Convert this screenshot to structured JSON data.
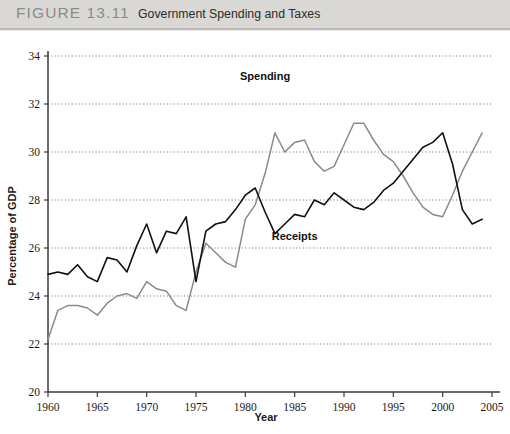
{
  "header": {
    "figure_number": "FIGURE 13.11",
    "figure_title": "Government Spending and Taxes",
    "band_color": "#d9d8d4"
  },
  "chart_data": {
    "type": "line",
    "title": "Government Spending and Taxes",
    "xlabel": "Year",
    "ylabel": "Percentage of GDP",
    "xlim": [
      1960,
      2005
    ],
    "ylim": [
      20,
      34
    ],
    "xticks": [
      1960,
      1965,
      1970,
      1975,
      1980,
      1985,
      1990,
      1995,
      2000,
      2005
    ],
    "yticks": [
      20,
      22,
      24,
      26,
      28,
      30,
      32,
      34
    ],
    "grid": "horizontal-dotted",
    "legend": "inline-annotations",
    "annotations": [
      {
        "text": "Spending",
        "x": 1982.0,
        "y": 33.0
      },
      {
        "text": "Receipts",
        "x": 1985.0,
        "y": 26.35
      }
    ],
    "series": [
      {
        "name": "Spending",
        "color": "#8a8a8a",
        "width": 1.5,
        "x": [
          1960,
          1961,
          1962,
          1963,
          1964,
          1965,
          1966,
          1967,
          1968,
          1969,
          1970,
          1971,
          1972,
          1973,
          1974,
          1975,
          1976,
          1977,
          1978,
          1979,
          1980,
          1981,
          1982,
          1983,
          1984,
          1985,
          1986,
          1987,
          1988,
          1989,
          1990,
          1991,
          1992,
          1993,
          1994,
          1995,
          1996,
          1997,
          1998,
          1999,
          2000,
          2001,
          2002,
          2003,
          2004
        ],
        "values": [
          22.2,
          23.4,
          23.6,
          23.6,
          23.5,
          23.2,
          23.7,
          24.0,
          24.1,
          23.9,
          24.6,
          24.3,
          24.2,
          23.6,
          23.4,
          25.0,
          26.2,
          25.8,
          25.4,
          25.2,
          27.2,
          27.8,
          29.1,
          30.8,
          30.0,
          30.4,
          30.5,
          29.6,
          29.2,
          29.4,
          30.3,
          31.2,
          31.2,
          30.5,
          29.9,
          29.6,
          29.0,
          28.3,
          27.7,
          27.4,
          27.3,
          28.2,
          29.2,
          30.0,
          30.8
        ]
      },
      {
        "name": "Receipts",
        "color": "#111111",
        "width": 1.6,
        "x": [
          1960,
          1961,
          1962,
          1963,
          1964,
          1965,
          1966,
          1967,
          1968,
          1969,
          1970,
          1971,
          1972,
          1973,
          1974,
          1975,
          1976,
          1977,
          1978,
          1979,
          1980,
          1981,
          1982,
          1983,
          1984,
          1985,
          1986,
          1987,
          1988,
          1989,
          1990,
          1991,
          1992,
          1993,
          1994,
          1995,
          1996,
          1997,
          1998,
          1999,
          2000,
          2001,
          2002,
          2003,
          2004
        ],
        "values": [
          24.9,
          25.0,
          24.9,
          25.3,
          24.8,
          24.6,
          25.6,
          25.5,
          25.0,
          26.1,
          27.0,
          25.8,
          26.7,
          26.6,
          27.3,
          24.6,
          26.7,
          27.0,
          27.1,
          27.6,
          28.2,
          28.5,
          27.5,
          26.6,
          27.0,
          27.4,
          27.3,
          28.0,
          27.8,
          28.3,
          28.0,
          27.7,
          27.6,
          27.9,
          28.4,
          28.7,
          29.2,
          29.7,
          30.2,
          30.4,
          30.8,
          29.5,
          27.6,
          27.0,
          27.2
        ]
      }
    ]
  },
  "axis_text": {
    "x_label": "Year",
    "y_label": "Percentage of GDP",
    "x_ticks": [
      "1960",
      "1965",
      "1970",
      "1975",
      "1980",
      "1985",
      "1990",
      "1995",
      "2000",
      "2005"
    ],
    "y_ticks": [
      "20",
      "22",
      "24",
      "26",
      "28",
      "30",
      "32",
      "34"
    ]
  }
}
